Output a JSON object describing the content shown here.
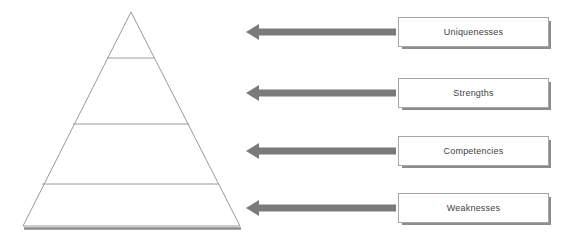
{
  "diagram": {
    "type": "pyramid-with-callouts",
    "title": "",
    "pyramid": {
      "name": "four-tier-pyramid",
      "outline_color": "#9a9a9a",
      "base_shadow_color": "#8c8c8c",
      "fill_color": "#ffffff",
      "apex": {
        "x": 131,
        "y": 12
      },
      "base_left": {
        "x": 23,
        "y": 226
      },
      "base_right": {
        "x": 240,
        "y": 226
      },
      "divider_y": [
        58,
        124,
        184
      ],
      "tiers": [
        {
          "index": 1,
          "position": "top"
        },
        {
          "index": 2,
          "position": "upper-middle"
        },
        {
          "index": 3,
          "position": "lower-middle"
        },
        {
          "index": 4,
          "position": "bottom"
        }
      ]
    },
    "arrow_color": "#7a7a7a",
    "box_border_color": "#a6a6a6",
    "box_fill_color": "#ffffff",
    "text_color": "#3f3f3f",
    "callouts": [
      {
        "label": "Uniquenesses",
        "tier": 1,
        "top": 15
      },
      {
        "label": "Strengths",
        "tier": 2,
        "top": 76
      },
      {
        "label": "Competencies",
        "tier": 3,
        "top": 134
      },
      {
        "label": "Weaknesses",
        "tier": 4,
        "top": 191
      }
    ]
  }
}
